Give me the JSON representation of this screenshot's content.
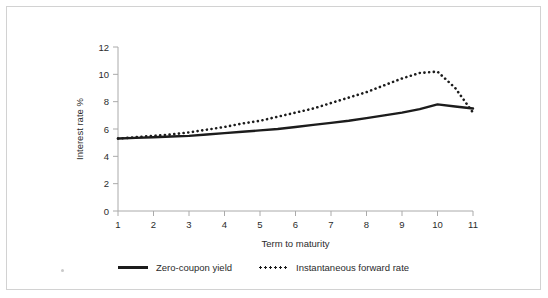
{
  "chart_data": {
    "type": "line",
    "title": "",
    "subtitle": "",
    "xlabel": "Term to maturity",
    "ylabel": "Interest rate %",
    "xlim": [
      1,
      11
    ],
    "ylim": [
      0,
      12
    ],
    "xticks": [
      "1",
      "2",
      "3",
      "4",
      "5",
      "6",
      "7",
      "8",
      "9",
      "10",
      "11"
    ],
    "yticks": [
      "0",
      "2",
      "4",
      "6",
      "8",
      "10",
      "12"
    ],
    "grid": false,
    "legend_position": "bottom",
    "series": [
      {
        "name": "Zero-coupon yield",
        "style": "solid",
        "color": "#1c1c1c",
        "x": [
          1,
          1.5,
          2,
          2.5,
          3,
          3.5,
          4,
          4.5,
          5,
          5.5,
          6,
          6.5,
          7,
          7.5,
          8,
          8.5,
          9,
          9.5,
          10,
          10.5,
          11
        ],
        "values": [
          5.3,
          5.35,
          5.4,
          5.45,
          5.5,
          5.6,
          5.7,
          5.8,
          5.9,
          6.0,
          6.15,
          6.3,
          6.45,
          6.6,
          6.8,
          7.0,
          7.2,
          7.45,
          7.8,
          7.65,
          7.5
        ]
      },
      {
        "name": "Instantaneous forward rate",
        "style": "dotted",
        "color": "#1c1c1c",
        "x": [
          1,
          1.5,
          2,
          2.5,
          3,
          3.5,
          4,
          4.5,
          5,
          5.5,
          6,
          6.5,
          7,
          7.5,
          8,
          8.5,
          9,
          9.5,
          10,
          10.5,
          11
        ],
        "values": [
          5.3,
          5.4,
          5.5,
          5.6,
          5.75,
          5.95,
          6.15,
          6.4,
          6.6,
          6.9,
          7.2,
          7.5,
          7.9,
          8.3,
          8.7,
          9.2,
          9.7,
          10.1,
          10.2,
          9.0,
          7.2
        ]
      }
    ]
  },
  "legend": {
    "items": [
      {
        "label": "Zero-coupon yield",
        "style": "solid"
      },
      {
        "label": "Instantaneous forward rate",
        "style": "dotted"
      }
    ]
  }
}
